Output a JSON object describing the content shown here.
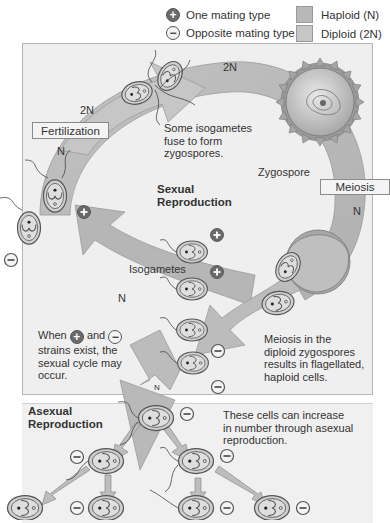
{
  "legend": {
    "mating_types": [
      {
        "symbol": "+",
        "label": "One mating type",
        "icon": "plus-circle-icon"
      },
      {
        "symbol": "−",
        "label": "Opposite mating type",
        "icon": "minus-circle-icon"
      }
    ],
    "ploidy": [
      {
        "label": "Haploid (N)",
        "color": "#b8b8b8"
      },
      {
        "label": "Diploid (2N)",
        "color": "#c6c6c6"
      }
    ]
  },
  "sexual_panel": {
    "title_line1": "Sexual",
    "title_line2": "Reproduction",
    "stages": {
      "fertilization": "Fertilization",
      "meiosis": "Meiosis",
      "zygospore": "Zygospore",
      "isogametes": "Isogametes"
    },
    "ploidy_labels": {
      "top_left": "2N",
      "top_right": "2N",
      "left": "N",
      "right": "N",
      "bottom": "N",
      "branch": "N"
    },
    "notes": {
      "fuse_line1": "Some isogametes",
      "fuse_line2": "fuse to form",
      "fuse_line3": "zygospores.",
      "when_line1_a": "When",
      "when_line1_b": "and",
      "when_line2": "strains exist, the",
      "when_line3": "sexual cycle may",
      "when_line4": "occur.",
      "meiosis_line1": "Meiosis in the",
      "meiosis_line2": "diploid zygospores",
      "meiosis_line3": "results in flagellated,",
      "meiosis_line4": "haploid cells."
    },
    "symbols": {
      "plus": "+",
      "minus": "−"
    }
  },
  "asexual_panel": {
    "title_line1": "Asexual",
    "title_line2": "Reproduction",
    "note_line1": "These cells can increase",
    "note_line2": "in number through asexual",
    "note_line3": "reproduction."
  },
  "colors": {
    "panel_bg": "#efefef",
    "panel_border": "#b5b5b5",
    "ring": "#b3b3b3",
    "ring_light": "#c4c4c4",
    "cell_fill": "#cfcfcf",
    "cell_outline": "#555555"
  }
}
